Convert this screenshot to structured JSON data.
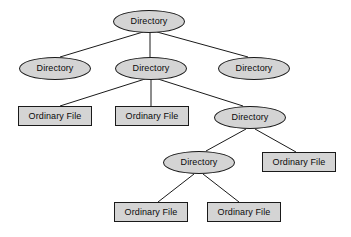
{
  "diagram": {
    "type": "tree",
    "node_fill_color": "#d4d4d4",
    "node_stroke_color": "#1a1a1a",
    "edge_color": "#1a1a1a",
    "background_color": "#ffffff",
    "labels": {
      "directory": "Directory",
      "ordinary_file": "Ordinary File"
    },
    "nodes": [
      {
        "id": "n0",
        "label": "Directory",
        "shape": "ellipse",
        "cx": 149,
        "cy": 21,
        "w": 72,
        "h": 23
      },
      {
        "id": "n1",
        "label": "Directory",
        "shape": "ellipse",
        "cx": 55,
        "cy": 68,
        "w": 72,
        "h": 23
      },
      {
        "id": "n2",
        "label": "Directory",
        "shape": "ellipse",
        "cx": 151,
        "cy": 68,
        "w": 72,
        "h": 23
      },
      {
        "id": "n3",
        "label": "Directory",
        "shape": "ellipse",
        "cx": 254,
        "cy": 68,
        "w": 72,
        "h": 23
      },
      {
        "id": "n4",
        "label": "Ordinary File",
        "shape": "rect",
        "cx": 55,
        "cy": 116,
        "w": 74,
        "h": 20
      },
      {
        "id": "n5",
        "label": "Ordinary File",
        "shape": "rect",
        "cx": 152,
        "cy": 116,
        "w": 74,
        "h": 20
      },
      {
        "id": "n6",
        "label": "Directory",
        "shape": "ellipse",
        "cx": 250,
        "cy": 117,
        "w": 72,
        "h": 23
      },
      {
        "id": "n7",
        "label": "Directory",
        "shape": "ellipse",
        "cx": 199,
        "cy": 162,
        "w": 72,
        "h": 23
      },
      {
        "id": "n8",
        "label": "Ordinary File",
        "shape": "rect",
        "cx": 299,
        "cy": 162,
        "w": 74,
        "h": 20
      },
      {
        "id": "n9",
        "label": "Ordinary File",
        "shape": "rect",
        "cx": 151,
        "cy": 212,
        "w": 74,
        "h": 20
      },
      {
        "id": "n10",
        "label": "Ordinary File",
        "shape": "rect",
        "cx": 244,
        "cy": 212,
        "w": 74,
        "h": 20
      }
    ],
    "edges": [
      {
        "from": "n0",
        "to": "n1",
        "x1": 143,
        "y1": 32,
        "x2": 60,
        "y2": 57
      },
      {
        "from": "n0",
        "to": "n2",
        "x1": 150,
        "y1": 33,
        "x2": 150,
        "y2": 57
      },
      {
        "from": "n0",
        "to": "n3",
        "x1": 157,
        "y1": 32,
        "x2": 248,
        "y2": 57
      },
      {
        "from": "n2",
        "to": "n4",
        "x1": 145,
        "y1": 79,
        "x2": 60,
        "y2": 106
      },
      {
        "from": "n2",
        "to": "n5",
        "x1": 151,
        "y1": 80,
        "x2": 151,
        "y2": 106
      },
      {
        "from": "n2",
        "to": "n6",
        "x1": 158,
        "y1": 79,
        "x2": 243,
        "y2": 106
      },
      {
        "from": "n6",
        "to": "n7",
        "x1": 246,
        "y1": 129,
        "x2": 206,
        "y2": 151
      },
      {
        "from": "n6",
        "to": "n8",
        "x1": 255,
        "y1": 129,
        "x2": 296,
        "y2": 152
      },
      {
        "from": "n7",
        "to": "n9",
        "x1": 194,
        "y1": 174,
        "x2": 158,
        "y2": 202
      },
      {
        "from": "n7",
        "to": "n10",
        "x1": 203,
        "y1": 174,
        "x2": 239,
        "y2": 202
      }
    ]
  }
}
